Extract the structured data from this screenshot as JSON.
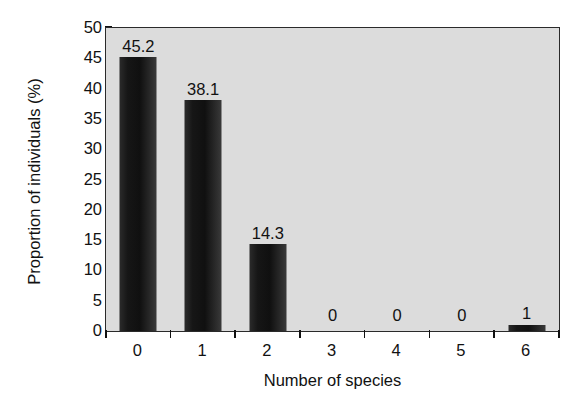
{
  "chart_data": {
    "type": "bar",
    "title": "",
    "subtitle": "",
    "xlabel": "Number of species",
    "ylabel": "Proportion of individuals (%)",
    "categories": [
      "0",
      "1",
      "2",
      "3",
      "4",
      "5",
      "6"
    ],
    "values": [
      45.2,
      38.1,
      14.3,
      0,
      0,
      0,
      1
    ],
    "data_labels": [
      "45.2",
      "38.1",
      "14.3",
      "0",
      "0",
      "0",
      "1"
    ],
    "ylim": [
      0,
      50
    ],
    "ytick_values": [
      0,
      5,
      10,
      15,
      20,
      25,
      30,
      35,
      40,
      45,
      50
    ],
    "ytick_labels": [
      "0",
      "5",
      "10",
      "15",
      "20",
      "25",
      "30",
      "35",
      "40",
      "45",
      "50"
    ],
    "grid": false,
    "legend": null,
    "legend_position": "none",
    "colors": {
      "bar": "#141414",
      "plot_background": "#dcdcdc",
      "axis": "#2a2a2a",
      "text": "#111111",
      "figure_background": "#ffffff"
    }
  }
}
